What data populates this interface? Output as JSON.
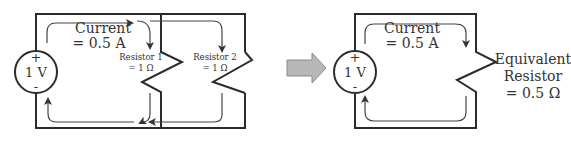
{
  "left_circuit": {
    "source": {
      "label": "1 V",
      "plus": "+",
      "minus": "-"
    },
    "current": {
      "line1": "Current",
      "line2": "= 0.5 A"
    },
    "resistor1": {
      "line1": "Resistor 1",
      "line2": "= 1 Ω"
    },
    "resistor2": {
      "line1": "Resistor 2",
      "line2": "= 1 Ω"
    }
  },
  "arrow": {
    "icon": "right-arrow-icon",
    "color": "#b8b8b8"
  },
  "right_circuit": {
    "source": {
      "label": "1 V",
      "plus": "+",
      "minus": "-"
    },
    "current": {
      "line1": "Current",
      "line2": "= 0.5 A"
    },
    "equivalent": {
      "line1": "Equivalent",
      "line2": "Resistor",
      "line3": "= 0.5 Ω"
    }
  }
}
